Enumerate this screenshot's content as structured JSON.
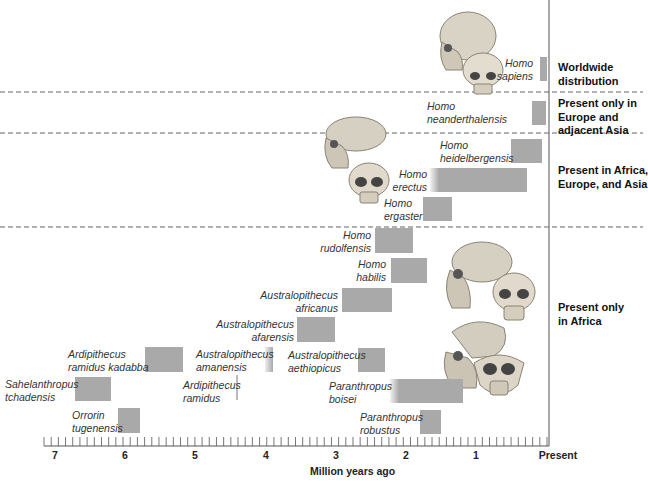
{
  "chart_data": {
    "type": "bar",
    "subtype": "floating-range timeline (hominin species)",
    "title": "",
    "xlabel": "Million years ago",
    "ylabel": "",
    "xlim": [
      7,
      0
    ],
    "x_ticks": [
      "7",
      "6",
      "5",
      "4",
      "3",
      "2",
      "1",
      "Present"
    ],
    "x_tick_values": [
      7,
      6,
      5,
      4,
      3,
      2,
      1,
      0
    ],
    "minor_ticks_per_major": 10,
    "grid": false,
    "series": [
      {
        "name": "Homo sapiens",
        "label_lines": [
          "Homo",
          "sapiens"
        ],
        "start_mya": 0.1,
        "end_mya": 0.0,
        "region": "Worldwide distribution"
      },
      {
        "name": "Homo neanderthalensis",
        "label_lines": [
          "Homo",
          "neanderthalensis"
        ],
        "start_mya": 0.2,
        "end_mya": 0.03,
        "region": "Present only in Europe and adjacent Asia"
      },
      {
        "name": "Homo heidelbergensis",
        "label_lines": [
          "Homo",
          "heidelbergensis"
        ],
        "start_mya": 0.5,
        "end_mya": 0.06,
        "region": "Present in Africa, Europe, and Asia"
      },
      {
        "name": "Homo erectus",
        "label_lines": [
          "Homo",
          "erectus"
        ],
        "start_mya": 1.8,
        "end_mya": 0.27,
        "region": "Present in Africa, Europe, and Asia"
      },
      {
        "name": "Homo ergaster",
        "label_lines": [
          "Homo",
          "ergaster"
        ],
        "start_mya": 1.9,
        "end_mya": 1.4,
        "region": "Present in Africa, Europe, and Asia"
      },
      {
        "name": "Homo rudolfensis",
        "label_lines": [
          "Homo",
          "rudolfensis"
        ],
        "start_mya": 2.4,
        "end_mya": 1.9,
        "region": "Present only in Africa"
      },
      {
        "name": "Homo habilis",
        "label_lines": [
          "Homo",
          "habilis"
        ],
        "start_mya": 2.2,
        "end_mya": 1.7,
        "region": "Present only in Africa"
      },
      {
        "name": "Australopithecus africanus",
        "label_lines": [
          "Australopithecus",
          "africanus"
        ],
        "start_mya": 2.9,
        "end_mya": 2.2,
        "region": "Present only in Africa"
      },
      {
        "name": "Australopithecus afarensis",
        "label_lines": [
          "Australopithecus",
          "afarensis"
        ],
        "start_mya": 3.6,
        "end_mya": 3.0,
        "region": "Present only in Africa"
      },
      {
        "name": "Ardipithecus ramidus kadabba",
        "label_lines": [
          "Ardipithecus",
          "ramidus kadabba"
        ],
        "start_mya": 5.8,
        "end_mya": 5.2,
        "region": "Present only in Africa"
      },
      {
        "name": "Australopithecus amanensis",
        "label_lines": [
          "Australopithecus",
          "amanensis"
        ],
        "start_mya": 4.2,
        "end_mya": 4.1,
        "region": "Present only in Africa"
      },
      {
        "name": "Australopithecus aethiopicus",
        "label_lines": [
          "Australopithecus",
          "aethiopicus"
        ],
        "start_mya": 2.7,
        "end_mya": 2.3,
        "region": "Present only in Africa"
      },
      {
        "name": "Ardipithecus ramidus",
        "label_lines": [
          "Ardipithecus",
          "ramidus"
        ],
        "start_mya": 4.4,
        "end_mya": 4.4,
        "region": "Present only in Africa"
      },
      {
        "name": "Paranthropus boisei",
        "label_lines": [
          "Paranthropus",
          "boisei"
        ],
        "start_mya": 2.3,
        "end_mya": 1.2,
        "region": "Present only in Africa"
      },
      {
        "name": "Sahelanthropus tchadensis",
        "label_lines": [
          "Sahelanthropus",
          "tchadensis"
        ],
        "start_mya": 6.7,
        "end_mya": 6.2,
        "region": "Present only in Africa"
      },
      {
        "name": "Orrorin tugenensis",
        "label_lines": [
          "Orrorin",
          "tugenensis"
        ],
        "start_mya": 6.1,
        "end_mya": 5.8,
        "region": "Present only in Africa"
      },
      {
        "name": "Paranthropus robustus",
        "label_lines": [
          "Paranthropus",
          "robustus"
        ],
        "start_mya": 1.8,
        "end_mya": 1.5,
        "region": "Present only in Africa"
      }
    ],
    "regions": [
      {
        "label_lines": [
          "Worldwide",
          "distribution"
        ]
      },
      {
        "label_lines": [
          "Present only in",
          "Europe and",
          "adjacent Asia"
        ]
      },
      {
        "label_lines": [
          "Present in Africa,",
          "Europe, and Asia"
        ]
      },
      {
        "label_lines": [
          "Present only",
          "in Africa"
        ]
      }
    ],
    "colors": {
      "bar": "#a9a9a9",
      "axis": "#555555",
      "divider": "#666666"
    }
  }
}
